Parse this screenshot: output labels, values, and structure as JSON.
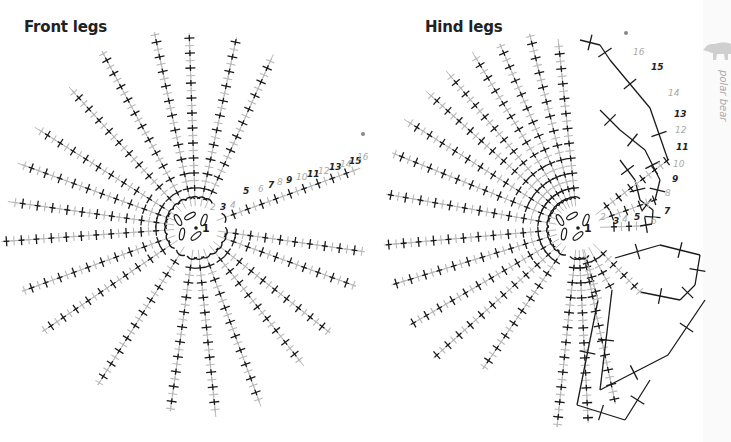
{
  "titles": {
    "front": "Front legs",
    "hind": "Hind legs"
  },
  "side_tab": {
    "label": "polar bear",
    "icon": "polar-bear-icon"
  },
  "colors": {
    "dark_stitch": "#1a1a1a",
    "light_stitch": "#b8b8b8",
    "label_dark": "#222222",
    "label_light": "#aaaaaa",
    "tab_bg": "#fafafa",
    "bear": "#cfcfcf"
  },
  "front_chart": {
    "center": [
      196,
      228
    ],
    "center_label": "1",
    "rays": [
      {
        "angle": -92,
        "len": 195
      },
      {
        "angle": -78,
        "len": 195
      },
      {
        "angle": -66,
        "len": 190
      },
      {
        "angle": -118,
        "len": 200
      },
      {
        "angle": -102,
        "len": 200
      },
      {
        "angle": -132,
        "len": 190
      },
      {
        "angle": -148,
        "len": 190
      },
      {
        "angle": -160,
        "len": 190
      },
      {
        "angle": -172,
        "len": 190
      },
      {
        "angle": 176,
        "len": 195
      },
      {
        "angle": 160,
        "len": 185
      },
      {
        "angle": 146,
        "len": 185
      },
      {
        "angle": 122,
        "len": 185
      },
      {
        "angle": 98,
        "len": 185
      },
      {
        "angle": 84,
        "len": 190
      },
      {
        "angle": 70,
        "len": 190
      },
      {
        "angle": 52,
        "len": 175
      },
      {
        "angle": 38,
        "len": 170
      },
      {
        "angle": 20,
        "len": 170
      },
      {
        "angle": 8,
        "len": 170
      },
      {
        "angle": -20,
        "len": 175
      }
    ],
    "row_numbers": [
      {
        "n": "2",
        "x": 210,
        "y": 210,
        "light": true
      },
      {
        "n": "3",
        "x": 220,
        "y": 210,
        "light": false
      },
      {
        "n": "4",
        "x": 230,
        "y": 208,
        "light": true
      },
      {
        "n": "5",
        "x": 243,
        "y": 194,
        "light": false
      },
      {
        "n": "6",
        "x": 258,
        "y": 192,
        "light": true
      },
      {
        "n": "7",
        "x": 268,
        "y": 188,
        "light": false
      },
      {
        "n": "8",
        "x": 277,
        "y": 185,
        "light": true
      },
      {
        "n": "9",
        "x": 286,
        "y": 183,
        "light": false
      },
      {
        "n": "10",
        "x": 296,
        "y": 180,
        "light": true
      },
      {
        "n": "11",
        "x": 307,
        "y": 177,
        "light": false
      },
      {
        "n": "12",
        "x": 318,
        "y": 174,
        "light": true
      },
      {
        "n": "13",
        "x": 329,
        "y": 170,
        "light": false
      },
      {
        "n": "14",
        "x": 340,
        "y": 167,
        "light": true
      },
      {
        "n": "15",
        "x": 349,
        "y": 164,
        "light": false
      },
      {
        "n": "16",
        "x": 357,
        "y": 160,
        "light": true
      }
    ],
    "end_dot": [
      363,
      134
    ]
  },
  "hind_chart": {
    "center": [
      578,
      228
    ],
    "center_label": "1",
    "rays": [
      {
        "angle": -96,
        "len": 190
      },
      {
        "angle": -104,
        "len": 200
      },
      {
        "angle": -113,
        "len": 200
      },
      {
        "angle": -121,
        "len": 205
      },
      {
        "angle": -130,
        "len": 205
      },
      {
        "angle": -138,
        "len": 205
      },
      {
        "angle": -148,
        "len": 205
      },
      {
        "angle": -158,
        "len": 200
      },
      {
        "angle": -170,
        "len": 195
      },
      {
        "angle": 175,
        "len": 195
      },
      {
        "angle": 163,
        "len": 195
      },
      {
        "angle": 150,
        "len": 195
      },
      {
        "angle": 138,
        "len": 195
      },
      {
        "angle": 124,
        "len": 170
      },
      {
        "angle": 96,
        "len": 200
      },
      {
        "angle": 87,
        "len": 195
      },
      {
        "angle": 78,
        "len": 180
      }
    ],
    "wedge_paths": [
      [
        [
          578,
          228
        ],
        [
          640,
          226
        ],
        [
          652,
          224
        ],
        [
          653,
          210
        ],
        [
          640,
          200
        ],
        [
          635,
          180
        ],
        [
          620,
          160
        ]
      ],
      [
        [
          578,
          228
        ],
        [
          655,
          200
        ],
        [
          660,
          180
        ],
        [
          645,
          150
        ],
        [
          620,
          130
        ],
        [
          600,
          110
        ]
      ],
      [
        [
          578,
          228
        ],
        [
          668,
          160
        ],
        [
          650,
          108
        ],
        [
          610,
          60
        ],
        [
          600,
          45
        ],
        [
          580,
          40
        ]
      ],
      [
        [
          578,
          228
        ],
        [
          640,
          292
        ],
        [
          680,
          300
        ],
        [
          695,
          285
        ],
        [
          700,
          255
        ],
        [
          660,
          245
        ],
        [
          615,
          258
        ]
      ],
      [
        [
          578,
          228
        ],
        [
          612,
          290
        ],
        [
          600,
          390
        ],
        [
          668,
          355
        ],
        [
          705,
          300
        ]
      ],
      [
        [
          578,
          228
        ],
        [
          598,
          300
        ],
        [
          577,
          405
        ],
        [
          625,
          420
        ],
        [
          650,
          380
        ]
      ]
    ],
    "row_numbers": [
      {
        "n": "2",
        "x": 600,
        "y": 220,
        "light": true
      },
      {
        "n": "3",
        "x": 613,
        "y": 224,
        "light": false
      },
      {
        "n": "4",
        "x": 622,
        "y": 222,
        "light": true
      },
      {
        "n": "5",
        "x": 634,
        "y": 220,
        "light": false
      },
      {
        "n": "6",
        "x": 651,
        "y": 224,
        "light": true
      },
      {
        "n": "7",
        "x": 664,
        "y": 214,
        "light": false
      },
      {
        "n": "8",
        "x": 665,
        "y": 196,
        "light": true
      },
      {
        "n": "9",
        "x": 672,
        "y": 182,
        "light": false
      },
      {
        "n": "10",
        "x": 673,
        "y": 167,
        "light": true
      },
      {
        "n": "11",
        "x": 676,
        "y": 150,
        "light": false
      },
      {
        "n": "12",
        "x": 675,
        "y": 133,
        "light": true
      },
      {
        "n": "13",
        "x": 674,
        "y": 117,
        "light": false
      },
      {
        "n": "14",
        "x": 668,
        "y": 96,
        "light": true
      },
      {
        "n": "15",
        "x": 651,
        "y": 70,
        "light": false
      },
      {
        "n": "16",
        "x": 633,
        "y": 55,
        "light": true
      }
    ],
    "end_dot": [
      626,
      33
    ]
  }
}
